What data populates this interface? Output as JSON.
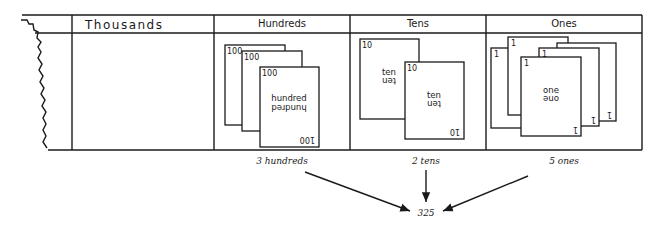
{
  "chart": {
    "columns": [
      {
        "id": "thousands",
        "label": "Thousands",
        "cards": 0
      },
      {
        "id": "hundreds",
        "label": "Hundreds",
        "cards": 3,
        "card_number": "100",
        "card_word": "hundred"
      },
      {
        "id": "tens",
        "label": "Tens",
        "cards": 2,
        "card_number": "10",
        "card_word": "ten"
      },
      {
        "id": "ones",
        "label": "Ones",
        "cards": 5,
        "card_number": "1",
        "card_word": "one"
      }
    ]
  },
  "captions": {
    "hundreds": "3 hundreds",
    "tens": "2 tens",
    "ones": "5 ones"
  },
  "result": "325",
  "colors": {
    "ink": "#1a1a1a",
    "paper": "#ffffff"
  }
}
